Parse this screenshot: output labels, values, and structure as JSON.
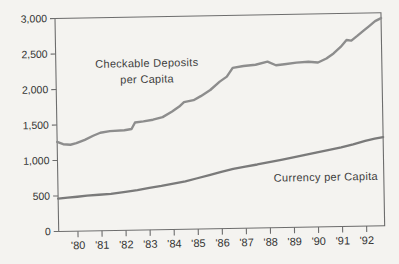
{
  "figure": {
    "background": "#f4f3f0",
    "frame_color": "#6d6d6d",
    "tick_text_color": "#333333",
    "annotation_text_color": "#3d3d3d"
  },
  "chart_data": {
    "type": "line",
    "title": "",
    "xlabel": "",
    "ylabel": "",
    "grid": false,
    "legend": "inline-annotations",
    "x_range": [
      1979.2,
      1992.75
    ],
    "y_range": [
      0,
      3000
    ],
    "y_ticks": {
      "values": [
        0,
        500,
        1000,
        1500,
        2000,
        2500,
        3000
      ],
      "labels": [
        "0",
        "500",
        "1,000",
        "1,500",
        "2,000",
        "2,500",
        "3,000"
      ]
    },
    "x_ticks": {
      "values": [
        1980,
        1981,
        1982,
        1983,
        1984,
        1985,
        1986,
        1987,
        1988,
        1989,
        1990,
        1991,
        1992
      ],
      "labels": [
        "'80",
        "'81",
        "'82",
        "'83",
        "'84",
        "'85",
        "'86",
        "'87",
        "'88",
        "'89",
        "'90",
        "'91",
        "'92"
      ]
    },
    "series": [
      {
        "name": "Checkable Deposits per Capita",
        "color": "#8d8d8d",
        "stroke_width": 2.4,
        "annotation": {
          "line1": "Checkable  Deposits",
          "line2": "per Capita"
        },
        "points": [
          [
            1979.2,
            1260
          ],
          [
            1979.45,
            1228
          ],
          [
            1979.75,
            1218
          ],
          [
            1980.0,
            1240
          ],
          [
            1980.35,
            1285
          ],
          [
            1980.7,
            1340
          ],
          [
            1981.0,
            1380
          ],
          [
            1981.4,
            1400
          ],
          [
            1982.0,
            1410
          ],
          [
            1982.3,
            1425
          ],
          [
            1982.45,
            1515
          ],
          [
            1982.8,
            1530
          ],
          [
            1983.2,
            1550
          ],
          [
            1983.6,
            1585
          ],
          [
            1984.0,
            1660
          ],
          [
            1984.3,
            1730
          ],
          [
            1984.5,
            1790
          ],
          [
            1984.9,
            1815
          ],
          [
            1985.2,
            1870
          ],
          [
            1985.6,
            1955
          ],
          [
            1986.0,
            2070
          ],
          [
            1986.3,
            2140
          ],
          [
            1986.55,
            2260
          ],
          [
            1987.0,
            2285
          ],
          [
            1987.5,
            2300
          ],
          [
            1988.0,
            2340
          ],
          [
            1988.35,
            2288
          ],
          [
            1988.7,
            2300
          ],
          [
            1989.2,
            2320
          ],
          [
            1989.7,
            2330
          ],
          [
            1990.1,
            2315
          ],
          [
            1990.45,
            2370
          ],
          [
            1990.75,
            2440
          ],
          [
            1991.05,
            2530
          ],
          [
            1991.3,
            2625
          ],
          [
            1991.5,
            2615
          ],
          [
            1991.75,
            2680
          ],
          [
            1992.0,
            2750
          ],
          [
            1992.25,
            2815
          ],
          [
            1992.5,
            2885
          ],
          [
            1992.75,
            2925
          ]
        ]
      },
      {
        "name": "Currency per Capita",
        "color": "#7a7a7a",
        "stroke_width": 2.3,
        "annotation": {
          "line1": "Currency per Capita",
          "line2": ""
        },
        "points": [
          [
            1979.2,
            462
          ],
          [
            1979.6,
            473
          ],
          [
            1980.0,
            485
          ],
          [
            1980.4,
            498
          ],
          [
            1980.9,
            507
          ],
          [
            1981.4,
            515
          ],
          [
            1982.0,
            542
          ],
          [
            1982.5,
            563
          ],
          [
            1983.0,
            590
          ],
          [
            1983.5,
            615
          ],
          [
            1984.0,
            645
          ],
          [
            1984.5,
            675
          ],
          [
            1985.0,
            715
          ],
          [
            1985.5,
            757
          ],
          [
            1986.0,
            800
          ],
          [
            1986.5,
            838
          ],
          [
            1987.0,
            868
          ],
          [
            1987.5,
            895
          ],
          [
            1988.0,
            925
          ],
          [
            1988.5,
            955
          ],
          [
            1989.0,
            985
          ],
          [
            1989.5,
            1017
          ],
          [
            1990.0,
            1050
          ],
          [
            1990.5,
            1082
          ],
          [
            1991.0,
            1115
          ],
          [
            1991.5,
            1155
          ],
          [
            1992.0,
            1200
          ],
          [
            1992.4,
            1228
          ],
          [
            1992.75,
            1250
          ]
        ]
      }
    ]
  }
}
